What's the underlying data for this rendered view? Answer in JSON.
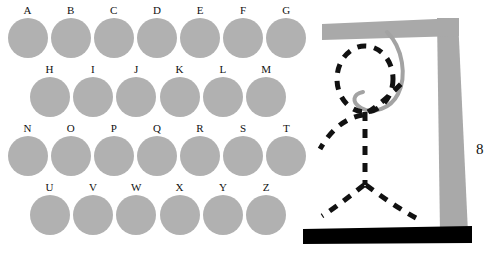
{
  "app": {
    "title": "Hangman",
    "background_color": "#ffffff"
  },
  "letter_board": {
    "name": "alphabet-letter-board",
    "disc_color": "#b1b1b1",
    "label_color": "#111111",
    "rows": [
      {
        "style": "wide",
        "letters": [
          {
            "label": "A",
            "state": "available"
          },
          {
            "label": "B",
            "state": "available"
          },
          {
            "label": "C",
            "state": "available"
          },
          {
            "label": "D",
            "state": "available"
          },
          {
            "label": "E",
            "state": "available"
          },
          {
            "label": "F",
            "state": "available"
          },
          {
            "label": "G",
            "state": "available"
          }
        ]
      },
      {
        "style": "inset",
        "letters": [
          {
            "label": "H",
            "state": "available"
          },
          {
            "label": "I",
            "state": "available"
          },
          {
            "label": "J",
            "state": "available"
          },
          {
            "label": "K",
            "state": "available"
          },
          {
            "label": "L",
            "state": "available"
          },
          {
            "label": "M",
            "state": "available"
          }
        ]
      },
      {
        "style": "wide",
        "letters": [
          {
            "label": "N",
            "state": "available"
          },
          {
            "label": "O",
            "state": "available"
          },
          {
            "label": "P",
            "state": "available"
          },
          {
            "label": "Q",
            "state": "available"
          },
          {
            "label": "R",
            "state": "available"
          },
          {
            "label": "S",
            "state": "available"
          },
          {
            "label": "T",
            "state": "available"
          }
        ]
      },
      {
        "style": "inset",
        "letters": [
          {
            "label": "U",
            "state": "available"
          },
          {
            "label": "V",
            "state": "available"
          },
          {
            "label": "W",
            "state": "available"
          },
          {
            "label": "X",
            "state": "available"
          },
          {
            "label": "Y",
            "state": "available"
          },
          {
            "label": "Z",
            "state": "available"
          }
        ]
      }
    ]
  },
  "gallows": {
    "name": "hangman-gallows",
    "frame_color": "#a9a9a9",
    "base_color": "#000000",
    "rope_color": "#a0a0a0",
    "figure_color": "#111111",
    "parts_drawn": [
      "head",
      "body",
      "left-arm",
      "right-arm",
      "left-leg",
      "right-leg"
    ]
  },
  "edge_glyph": {
    "text": "8"
  }
}
